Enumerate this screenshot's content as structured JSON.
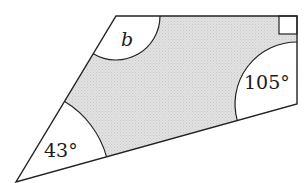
{
  "diagram": {
    "type": "quadrilateral-angles",
    "shape": "quadrilateral",
    "vertices": {
      "top_left": [
        116,
        16
      ],
      "top_right": [
        297,
        16
      ],
      "bottom_right": [
        297,
        104
      ],
      "bottom_left": [
        16,
        182
      ]
    },
    "fill_color": "#dcdcdc",
    "stroke_color": "#222222",
    "angle_fill_color": "#ffffff",
    "angles": [
      {
        "vertex": "top_left",
        "label": "b",
        "italic": true
      },
      {
        "vertex": "top_right",
        "label": "",
        "right_angle": true
      },
      {
        "vertex": "bottom_right",
        "label": "105°"
      },
      {
        "vertex": "bottom_left",
        "label": "43°"
      }
    ]
  },
  "labels": {
    "angle_b": "b",
    "angle_105": "105°",
    "angle_43": "43°"
  }
}
